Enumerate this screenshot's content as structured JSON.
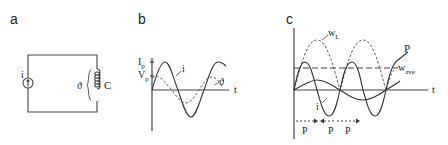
{
  "panels": {
    "a": {
      "label": "a",
      "source_label": "i",
      "voltage_label": "ϑ",
      "element_label": "C"
    },
    "b": {
      "label": "b",
      "y_tick_current": "I",
      "y_tick_current_sub": "p",
      "y_tick_voltage": "V",
      "y_tick_voltage_sub": "p",
      "curve_current_label": "i",
      "curve_voltage_label": "ϑ",
      "x_axis_label": "t"
    },
    "c": {
      "label": "c",
      "curve_energy_label": "w",
      "curve_energy_sub": "L",
      "curve_power_label": "P",
      "avg_label": "w",
      "avg_sub": "ave",
      "curve_current_label": "i",
      "x_axis_label": "t",
      "period_labels": [
        "P",
        "P",
        "P"
      ]
    }
  },
  "colors": {
    "ink": "#333333",
    "background": "#ffffff"
  }
}
